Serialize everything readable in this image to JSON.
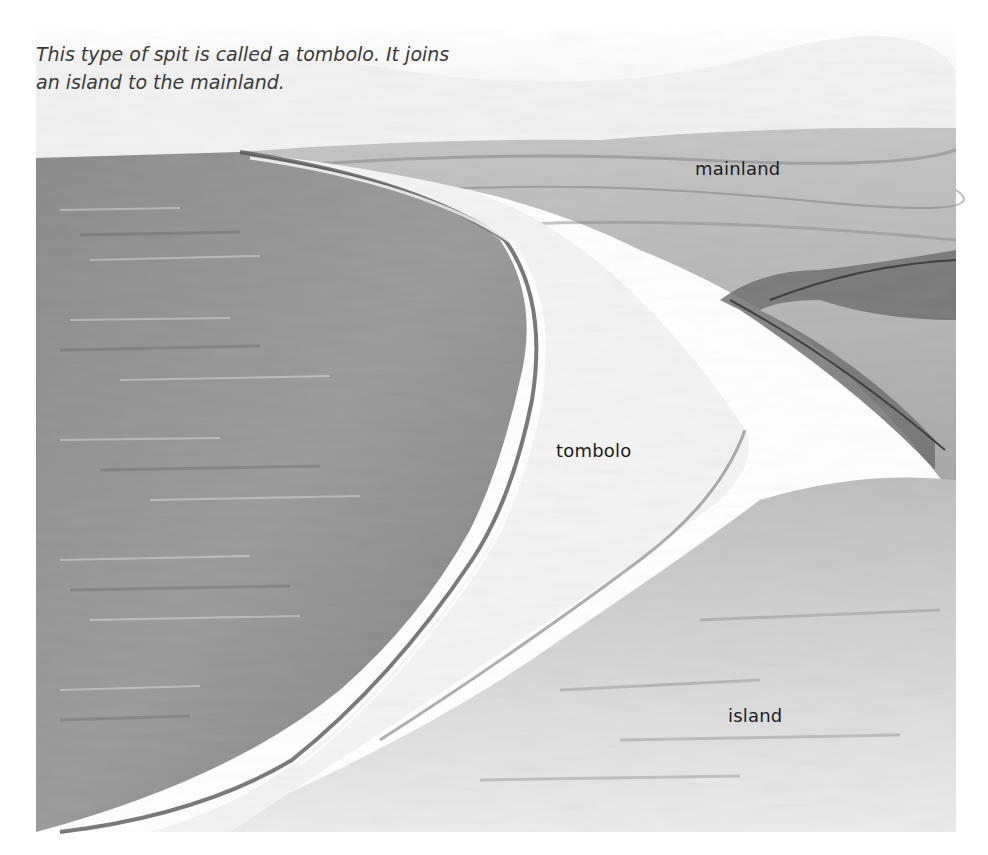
{
  "caption": {
    "line1": "This type of spit is called a tombolo. It joins",
    "line2": "an island to the mainland."
  },
  "labels": {
    "mainland": "mainland",
    "tombolo": "tombolo",
    "island": "island"
  },
  "illustration": {
    "subject": "watercolor illustration of a tombolo joining an island to the mainland",
    "colors": {
      "sky": "#f6f6f6",
      "sea": "#8f8f8f",
      "sea_dark": "#6e6e6e",
      "sand": "#f2f2f2",
      "land": "#b8b8b8",
      "land_dark": "#7a7a7a"
    }
  }
}
